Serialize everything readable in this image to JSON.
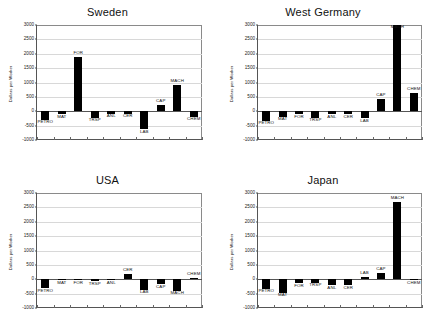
{
  "figure": {
    "page_mark": "",
    "panel_order": [
      "sweden",
      "west_germany",
      "usa",
      "japan"
    ]
  },
  "axis": {
    "ylabel": "Dollars per Worker",
    "yticks": [
      "3000",
      "2500",
      "2000",
      "1500",
      "1000",
      "500",
      "0",
      "-500",
      "-1000"
    ],
    "ymin": -1000,
    "ymax": 3000,
    "ystep": 500
  },
  "chart_data": [
    {
      "type": "bar",
      "title": "Sweden",
      "xlabel": "",
      "ylabel": "Dollars per Worker",
      "ylim": [
        -1000,
        3000
      ],
      "grid": true,
      "legend": "none",
      "categories": [
        "PETRO",
        "MAT",
        "FOR",
        "TRSP",
        "ANL",
        "CER",
        "LAB",
        "CAP",
        "MACH",
        "CHEM"
      ],
      "values": [
        -300,
        -110,
        1900,
        -230,
        -90,
        -80,
        -620,
        210,
        900,
        -190
      ]
    },
    {
      "type": "bar",
      "title": "West Germany",
      "xlabel": "",
      "ylabel": "Dollars per Worker",
      "ylim": [
        -1000,
        3000
      ],
      "grid": true,
      "legend": "none",
      "categories": [
        "PETRO",
        "MAT",
        "FOR",
        "TRSP",
        "ANL",
        "CER",
        "LAB",
        "CAP",
        "MACH",
        "CHEM"
      ],
      "values": [
        -330,
        -190,
        -110,
        -220,
        -110,
        -110,
        -250,
        430,
        3000,
        650
      ]
    },
    {
      "type": "bar",
      "title": "USA",
      "xlabel": "",
      "ylabel": "Dollars per Worker",
      "ylim": [
        -1000,
        3000
      ],
      "grid": true,
      "legend": "none",
      "categories": [
        "PETRO",
        "MAT",
        "FOR",
        "TRSP",
        "ANL",
        "CER",
        "LAB",
        "CAP",
        "MACH",
        "CHEM"
      ],
      "values": [
        -320,
        -40,
        -30,
        -70,
        -40,
        180,
        -370,
        -180,
        -400,
        60
      ]
    },
    {
      "type": "bar",
      "title": "Japan",
      "xlabel": "",
      "ylabel": "Dollars per Worker",
      "ylim": [
        -1000,
        3000
      ],
      "grid": true,
      "legend": "none",
      "categories": [
        "PETRO",
        "MAT",
        "FOR",
        "TRSP",
        "ANL",
        "CER",
        "LAB",
        "CAP",
        "MACH",
        "CHEM"
      ],
      "values": [
        -330,
        -470,
        -140,
        -130,
        -210,
        -200,
        70,
        230,
        2700,
        -20
      ]
    }
  ],
  "colors": {
    "bar": "#000000",
    "grid": "#d8d8d8",
    "axis": "#555555",
    "text": "#111111",
    "background": "#ffffff"
  }
}
